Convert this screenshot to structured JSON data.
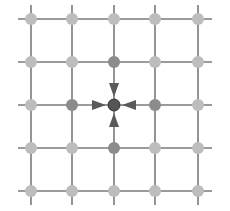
{
  "diagram": {
    "type": "grid-graph",
    "rows": 5,
    "cols": 5,
    "xs": [
      31,
      72,
      114,
      155,
      198
    ],
    "ys": [
      19,
      62,
      105,
      148,
      191
    ],
    "line_extent": {
      "x1": 18,
      "x2": 212,
      "y1": 5,
      "y2": 205
    },
    "colors": {
      "line": "#7a7a7a",
      "node_default": "#bdbdbd",
      "node_neighbor": "#8c8c8c",
      "node_center": "#555555",
      "arrow": "#5a5a5a"
    },
    "center": {
      "row": 2,
      "col": 2
    },
    "neighbors": [
      {
        "row": 1,
        "col": 2,
        "direction": "down"
      },
      {
        "row": 2,
        "col": 1,
        "direction": "right"
      },
      {
        "row": 2,
        "col": 3,
        "direction": "left"
      },
      {
        "row": 3,
        "col": 2,
        "direction": "up"
      }
    ]
  }
}
